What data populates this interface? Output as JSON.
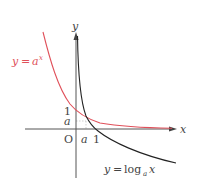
{
  "diagram": {
    "axes": {
      "x_label": "x",
      "y_label": "y",
      "origin_label": "O"
    },
    "ticks": {
      "x": [
        {
          "label": "a"
        },
        {
          "label": "1"
        }
      ],
      "y": [
        {
          "label": "1"
        },
        {
          "label": "a"
        }
      ]
    },
    "curves": [
      {
        "name": "exponential",
        "label_lhs": "y",
        "label_eq": "=",
        "label_base": "a",
        "label_exp": "x",
        "color": "#e0505a"
      },
      {
        "name": "logarithm",
        "label_lhs": "y",
        "label_eq": "=",
        "label_fn": "log",
        "label_sub": "a",
        "label_arg": "x",
        "color": "#222222"
      }
    ],
    "colors": {
      "axis": "#555555",
      "guide": "#bbbbbb",
      "red": "#e0505a",
      "black": "#222222",
      "text": "#444444"
    }
  }
}
